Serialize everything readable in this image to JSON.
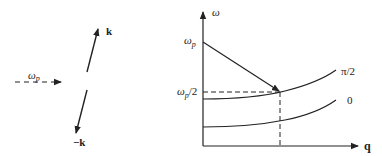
{
  "left_panel": {
    "pump_label": "ω",
    "pump_subscript": "p",
    "wave_up_label": "k",
    "wave_down_label": "−k"
  },
  "right_panel": {
    "y_axis_label": "ω",
    "x_axis_label": "q",
    "omega_p_label": "ω",
    "omega_p_subscript": "p",
    "omega_p_half_label": "ω",
    "omega_p_half_subscript": "p",
    "omega_p_half_suffix": "/2",
    "curve_upper_label": "π/2",
    "curve_lower_label": "0"
  },
  "colors": {
    "stroke": "#222222",
    "background": "#ffffff"
  }
}
